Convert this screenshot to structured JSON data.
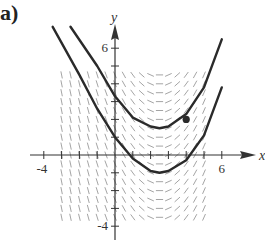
{
  "figure": {
    "part_label": "a)"
  },
  "chart_data": {
    "type": "line",
    "title": "",
    "subtitle": "Slope field with two solution curves",
    "xlabel": "x",
    "ylabel": "y",
    "xlim": [
      -4,
      7
    ],
    "ylim": [
      -4,
      6.5
    ],
    "x_tick_labels": [
      "-4",
      "6"
    ],
    "y_tick_labels": [
      "6",
      "-4"
    ],
    "x_ticks": [
      -4,
      -3,
      -2,
      -1,
      0,
      1,
      2,
      3,
      4,
      5,
      6
    ],
    "y_ticks": [
      -4,
      -3,
      -2,
      -1,
      0,
      1,
      2,
      3,
      4,
      5,
      6
    ],
    "grid": false,
    "legend": null,
    "slope_field": {
      "x_range": [
        -3,
        5
      ],
      "y_range": [
        -3.5,
        4.5
      ],
      "description": "Negative slopes for x < 2, near-zero around x = 2, positive slopes for x > 2"
    },
    "series": [
      {
        "name": "upper solution curve",
        "x": [
          -2.5,
          -1,
          0,
          1,
          2,
          2.5,
          3,
          4,
          5,
          6
        ],
        "y": [
          7.2,
          5,
          3.3,
          2.1,
          1.6,
          1.5,
          1.6,
          2.3,
          3.8,
          6.5
        ]
      },
      {
        "name": "lower solution curve",
        "x": [
          -3.5,
          -2,
          -1,
          0,
          1,
          2,
          2.5,
          3,
          4,
          5,
          6
        ],
        "y": [
          7.2,
          4.5,
          2.6,
          1.0,
          -0.2,
          -0.9,
          -1.0,
          -0.9,
          -0.3,
          1.1,
          3.8
        ]
      }
    ],
    "annotations": [
      {
        "type": "point",
        "x": 4,
        "y": 2,
        "label": ""
      }
    ]
  }
}
